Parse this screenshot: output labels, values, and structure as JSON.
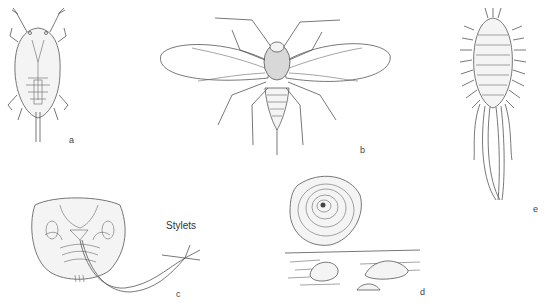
{
  "figure": {
    "panels": [
      {
        "id": "a",
        "label": "a",
        "subject": "scale insect crawler (ventral view)"
      },
      {
        "id": "b",
        "label": "b",
        "subject": "winged adult male scale insect"
      },
      {
        "id": "c",
        "label": "c",
        "subject": "mouthparts with stylets",
        "annotation": "Stylets"
      },
      {
        "id": "d",
        "label": "d",
        "subject": "armored scale covers on surface"
      },
      {
        "id": "e",
        "label": "e",
        "subject": "mealybug with waxy filaments"
      }
    ]
  }
}
